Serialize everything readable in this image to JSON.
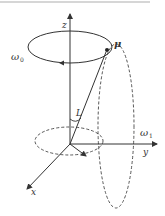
{
  "figure": {
    "type": "precession-diagram",
    "axes": {
      "x": "x",
      "y": "y",
      "z": "z"
    },
    "labels": {
      "omega0": "ω",
      "omega0_sub": "0",
      "omega1": "ω",
      "omega1_sub": "1",
      "mu": "μ",
      "angle": "L"
    },
    "colors": {
      "line": "#333333",
      "dashed": "#444444"
    }
  }
}
